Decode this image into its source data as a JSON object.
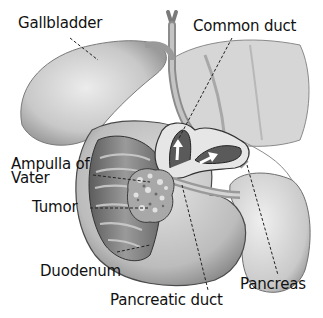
{
  "diagram": {
    "labels": {
      "gallbladder": "Gallbladder",
      "common_duct": "Common duct",
      "ampulla_of_vater": "Ampulla of\nVater",
      "tumor": "Tumor",
      "duodenum": "Duodenum",
      "pancreatic_duct": "Pancreatic duct",
      "pancreas": "Pancreas"
    },
    "colors": {
      "background": "#ffffff",
      "text": "#111111",
      "organ_light": "#dcdcdc",
      "organ_mid": "#b0b0b0",
      "organ_dark": "#6e6e6e",
      "outline": "#3a3a3a"
    }
  }
}
